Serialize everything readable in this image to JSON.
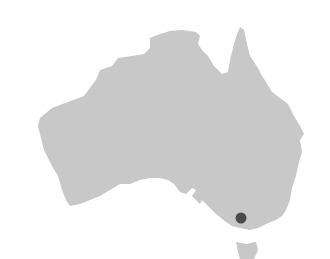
{
  "map": {
    "region": "Australia",
    "land_color": "#c8c8c8",
    "background_color": "#ffffff",
    "marker": {
      "label": "Location marker",
      "color": "#4a4a4a",
      "cx": 241,
      "cy": 218,
      "r": 5.5
    },
    "landmasses": [
      {
        "name": "Mainland Australia",
        "points": "40,118 52,108 68,102 84,96 96,80 100,70 112,66 118,58 132,56 144,54 150,48 150,38 160,34 170,31 182,30 196,32 200,36 198,44 202,50 208,56 214,66 222,74 228,72 230,60 234,44 237,34 240,27 244,30 247,44 250,56 254,62 258,68 262,76 266,82 272,92 280,98 288,104 294,116 300,126 304,134 300,140 302,152 298,166 296,176 292,188 290,200 286,210 282,216 276,220 266,224 258,228 250,230 240,228 232,226 226,222 216,214 210,208 202,200 200,204 196,200 192,196 196,190 192,188 186,194 180,192 174,184 168,180 160,178 150,178 140,180 130,184 120,184 110,190 100,196 90,200 80,204 70,206 66,200 62,190 58,176 52,166 48,158 44,150 42,142 40,134 38,126"
      },
      {
        "name": "Tasmania",
        "points": "236,242 246,244 256,242 258,250 254,259 240,259 238,252"
      }
    ]
  }
}
